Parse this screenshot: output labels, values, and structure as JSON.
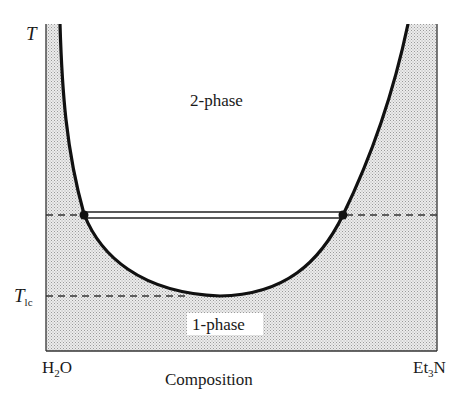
{
  "diagram": {
    "y_axis": {
      "symbol": "T",
      "tick_label_main": "T",
      "tick_label_sub": "lc"
    },
    "x_axis": {
      "label": "Composition",
      "left_end_main": "H",
      "left_end_sub": "2",
      "left_end_tail": "O",
      "right_end_main": "Et",
      "right_end_sub": "3",
      "right_end_tail": "N"
    },
    "regions": {
      "upper": "2-phase",
      "lower": "1-phase"
    },
    "colors": {
      "curve": "#111111",
      "shading_dot": "#9a9a9a",
      "shading_bg": "#ececec",
      "axis": "#333333",
      "dashed": "#333333"
    },
    "features": {
      "lower_critical_temperature_line": "dashed, at T_lc, meets curve minimum",
      "tie_line": "double line between two coexistence points",
      "tie_line_dashed_extension": "dashed line across full width at tie-line temperature",
      "coexistence_points": 2
    }
  }
}
